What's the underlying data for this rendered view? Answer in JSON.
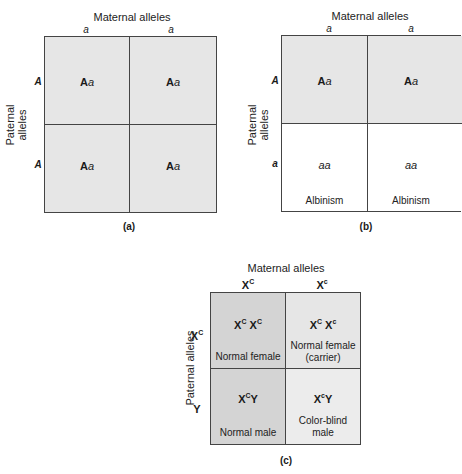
{
  "panel_a": {
    "top_label": "Maternal alleles",
    "side_label": "Paternal alleles",
    "side_label_line1": "Paternal",
    "side_label_line2": "alleles",
    "columns": [
      "a",
      "a"
    ],
    "rows": [
      "A",
      "A"
    ],
    "cells": [
      [
        "Aa",
        "Aa"
      ],
      [
        "Aa",
        "Aa"
      ]
    ],
    "caption": "(a)"
  },
  "panel_b": {
    "top_label": "Maternal alleles",
    "side_label_line1": "Paternal",
    "side_label_line2": "alleles",
    "columns": [
      "a",
      "a"
    ],
    "rows": [
      "A",
      "a"
    ],
    "cells": [
      [
        "Aa",
        "Aa"
      ],
      [
        "aa",
        "aa"
      ]
    ],
    "phenotypes": [
      [
        "",
        ""
      ],
      [
        "Albinism",
        "Albinism"
      ]
    ],
    "caption": "(b)"
  },
  "panel_c": {
    "top_label": "Maternal alleles",
    "side_label": "Paternal alleles",
    "columns": [
      {
        "base": "X",
        "sup": "C"
      },
      {
        "base": "X",
        "sup": "c"
      }
    ],
    "rows": [
      {
        "base": "X",
        "sup": "C"
      },
      {
        "base": "Y",
        "sup": ""
      }
    ],
    "cells": [
      [
        {
          "g1": "X",
          "s1": "C",
          "g2": "X",
          "s2": "C",
          "pheno1": "Normal female",
          "pheno2": ""
        },
        {
          "g1": "X",
          "s1": "C",
          "g2": "X",
          "s2": "c",
          "pheno1": "Normal female",
          "pheno2": "(carrier)"
        }
      ],
      [
        {
          "g1": "X",
          "s1": "C",
          "g2": "Y",
          "s2": "",
          "pheno1": "Normal male",
          "pheno2": ""
        },
        {
          "g1": "X",
          "s1": "c",
          "g2": "Y",
          "s2": "",
          "pheno1": "Color-blind",
          "pheno2": "male"
        }
      ]
    ],
    "caption": "(c)"
  },
  "colors": {
    "cell_light": "#e6e6e6",
    "cell_dark": "#d4d4d4",
    "border": "#444444"
  }
}
